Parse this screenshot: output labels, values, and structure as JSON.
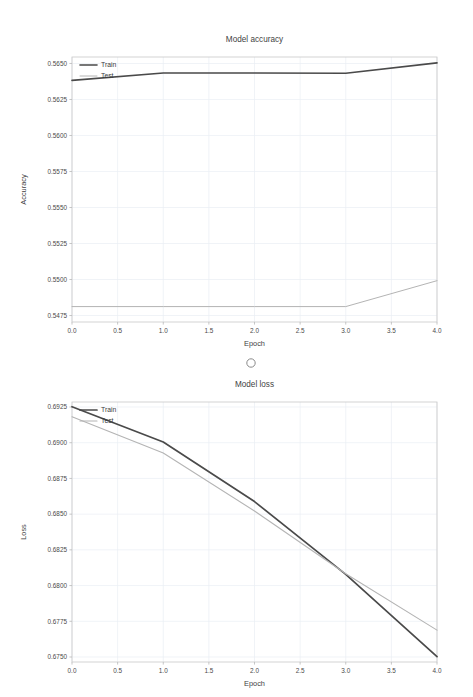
{
  "page": {
    "background_color": "#ffffff",
    "separator_marker": "circle-marker"
  },
  "charts": [
    {
      "id": "accuracy",
      "title": "Model accuracy",
      "xlabel": "Epoch",
      "ylabel": "Accuracy"
    },
    {
      "id": "loss",
      "title": "Model loss",
      "xlabel": "Epoch",
      "ylabel": "Loss"
    }
  ],
  "chart_data": [
    {
      "type": "line",
      "title": "Model accuracy",
      "xlabel": "Epoch",
      "ylabel": "Accuracy",
      "x": [
        0,
        1,
        2,
        3,
        4
      ],
      "xticks": [
        0.0,
        0.5,
        1.0,
        1.5,
        2.0,
        2.5,
        3.0,
        3.5,
        4.0
      ],
      "xticklabels": [
        "0.0",
        "0.5",
        "1.0",
        "1.5",
        "2.0",
        "2.5",
        "3.0",
        "3.5",
        "4.0"
      ],
      "yticks": [
        0.5475,
        0.55,
        0.5525,
        0.555,
        0.5575,
        0.56,
        0.5625,
        0.565
      ],
      "yticklabels": [
        "0.5475",
        "0.5500",
        "0.5525",
        "0.5550",
        "0.5575",
        "0.5600",
        "0.5625",
        "0.5650"
      ],
      "xlim": [
        0,
        4
      ],
      "ylim": [
        0.54705,
        0.56545
      ],
      "grid": true,
      "legend_position": "upper left",
      "series": [
        {
          "name": "Train",
          "color": "#4a4a4a",
          "width": 1.6,
          "values": [
            0.56383,
            0.56434,
            0.56434,
            0.56432,
            0.56504
          ]
        },
        {
          "name": "Test",
          "color": "#b4b4b4",
          "width": 1.0,
          "values": [
            0.54812,
            0.54812,
            0.54812,
            0.54812,
            0.54992
          ]
        }
      ]
    },
    {
      "type": "line",
      "title": "Model loss",
      "xlabel": "Epoch",
      "ylabel": "Loss",
      "x": [
        0,
        1,
        2,
        3,
        4
      ],
      "xticks": [
        0.0,
        0.5,
        1.0,
        1.5,
        2.0,
        2.5,
        3.0,
        3.5,
        4.0
      ],
      "xticklabels": [
        "0.0",
        "0.5",
        "1.0",
        "1.5",
        "2.0",
        "2.5",
        "3.0",
        "3.5",
        "4.0"
      ],
      "yticks": [
        0.675,
        0.6775,
        0.68,
        0.6825,
        0.685,
        0.6875,
        0.69,
        0.6925
      ],
      "yticklabels": [
        "0.6750",
        "0.6775",
        "0.6800",
        "0.6825",
        "0.6850",
        "0.6875",
        "0.6900",
        "0.6925"
      ],
      "xlim": [
        0,
        4
      ],
      "ylim": [
        0.67465,
        0.69285
      ],
      "grid": true,
      "legend_position": "upper left",
      "series": [
        {
          "name": "Train",
          "color": "#4a4a4a",
          "width": 1.7,
          "values": [
            0.69252,
            0.69005,
            0.68588,
            0.68078,
            0.67502
          ]
        },
        {
          "name": "Test",
          "color": "#b4b4b4",
          "width": 1.1,
          "values": [
            0.69182,
            0.68928,
            0.68522,
            0.68083,
            0.67688
          ]
        }
      ]
    }
  ]
}
